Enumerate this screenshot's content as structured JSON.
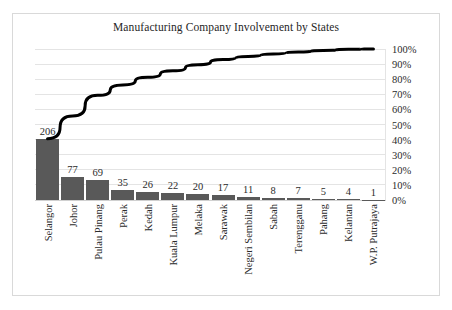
{
  "chart_data": {
    "type": "bar",
    "title": "Manufacturing Company Involvement by States",
    "xlabel": "",
    "ylabel": "",
    "categories": [
      "Selangor",
      "Johor",
      "Pulau Pinang",
      "Perak",
      "Kedah",
      "Kuala Lumpur",
      "Melaka",
      "Sarawak",
      "Negeri Sembilan",
      "Sabah",
      "Terengganu",
      "Pahang",
      "Kelantan",
      "W.P. Putrajaya"
    ],
    "values": [
      206,
      77,
      69,
      35,
      26,
      22,
      20,
      17,
      11,
      8,
      7,
      5,
      4,
      1
    ],
    "series": [
      {
        "name": "Count",
        "type": "bar",
        "values": [
          206,
          77,
          69,
          35,
          26,
          22,
          20,
          17,
          11,
          8,
          7,
          5,
          4,
          1
        ]
      },
      {
        "name": "Cumulative %",
        "type": "line",
        "axis": "right",
        "values": [
          40.6,
          55.7,
          69.3,
          76.2,
          81.3,
          85.6,
          89.6,
          93.0,
          95.1,
          96.7,
          98.0,
          99.0,
          99.8,
          100.0
        ]
      }
    ],
    "total": 508,
    "ylim": [
      0,
      508
    ],
    "y2lim": [
      0,
      100
    ],
    "y2ticks": [
      "0%",
      "10%",
      "20%",
      "30%",
      "40%",
      "50%",
      "60%",
      "70%",
      "80%",
      "90%",
      "100%"
    ],
    "grid": true,
    "legend": "none",
    "bar_color": "#595959",
    "line_color": "#000000",
    "grid_color": "#e4e4e4",
    "border_color": "#d9d9d9",
    "background_color": "#ffffff"
  }
}
